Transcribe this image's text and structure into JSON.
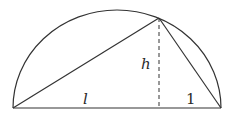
{
  "diagram": {
    "labels": {
      "left_segment": "l",
      "altitude": "h",
      "right_segment": "1"
    },
    "colors": {
      "stroke": "#333333",
      "background": "#ffffff"
    }
  }
}
